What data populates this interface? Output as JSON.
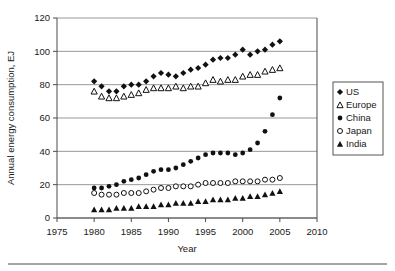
{
  "chart_data": {
    "type": "scatter",
    "title": "",
    "xlabel": "Year",
    "ylabel": "Annual energy consumption, EJ",
    "xlim": [
      1975,
      2010
    ],
    "ylim": [
      0,
      120
    ],
    "xticks": [
      1975,
      1980,
      1985,
      1990,
      1995,
      2000,
      2005,
      2010
    ],
    "yticks": [
      0,
      20,
      40,
      60,
      80,
      100,
      120
    ],
    "grid": "horizontal",
    "legend_position": "right-outside",
    "x": [
      1980,
      1981,
      1982,
      1983,
      1984,
      1985,
      1986,
      1987,
      1988,
      1989,
      1990,
      1991,
      1992,
      1993,
      1994,
      1995,
      1996,
      1997,
      1998,
      1999,
      2000,
      2001,
      2002,
      2003,
      2004,
      2005
    ],
    "series": [
      {
        "name": "US",
        "marker": "filled-diamond",
        "color": "#111111",
        "values": [
          82,
          79,
          76,
          76,
          79,
          80,
          80,
          82,
          85,
          87,
          86,
          85,
          87,
          89,
          90,
          92,
          95,
          96,
          96,
          98,
          101,
          98,
          100,
          101,
          104,
          106
        ]
      },
      {
        "name": "Europe",
        "marker": "open-triangle",
        "color": "#111111",
        "values": [
          76,
          73,
          72,
          72,
          73,
          74,
          75,
          77,
          78,
          78,
          78,
          79,
          78,
          79,
          79,
          81,
          83,
          82,
          83,
          83,
          85,
          86,
          86,
          88,
          89,
          90
        ]
      },
      {
        "name": "China",
        "marker": "filled-circle",
        "color": "#111111",
        "values": [
          18,
          18,
          19,
          20,
          22,
          23,
          24,
          26,
          28,
          29,
          29,
          30,
          32,
          34,
          36,
          38,
          39,
          39,
          39,
          38,
          39,
          41,
          45,
          52,
          62,
          72
        ]
      },
      {
        "name": "Japan",
        "marker": "open-circle",
        "color": "#111111",
        "values": [
          15,
          14,
          14,
          14,
          15,
          15,
          15,
          16,
          17,
          18,
          18,
          19,
          19,
          19,
          20,
          21,
          21,
          21,
          21,
          22,
          22,
          22,
          22,
          23,
          23,
          24
        ]
      },
      {
        "name": "India",
        "marker": "filled-triangle",
        "color": "#111111",
        "values": [
          5,
          5,
          5,
          6,
          6,
          6,
          7,
          7,
          7,
          8,
          8,
          9,
          9,
          9,
          10,
          10,
          11,
          11,
          11,
          12,
          12,
          13,
          13,
          14,
          15,
          16
        ]
      }
    ]
  },
  "axes": {
    "y_title": "Annual energy consumption, EJ",
    "x_title": "Year",
    "y_tick_labels": [
      "0",
      "20",
      "40",
      "60",
      "80",
      "100",
      "120"
    ],
    "x_tick_labels": [
      "1975",
      "1980",
      "1985",
      "1990",
      "1995",
      "2000",
      "2005",
      "2010"
    ]
  },
  "legend": {
    "items": [
      {
        "label": "US",
        "marker": "filled-diamond"
      },
      {
        "label": "Europe",
        "marker": "open-triangle"
      },
      {
        "label": "China",
        "marker": "filled-circle"
      },
      {
        "label": "Japan",
        "marker": "open-circle"
      },
      {
        "label": "India",
        "marker": "filled-triangle"
      }
    ]
  }
}
